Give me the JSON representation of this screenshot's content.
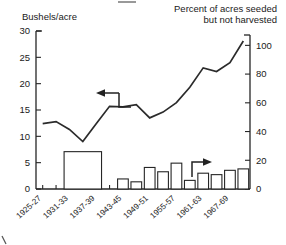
{
  "chart_data": {
    "type": "line",
    "title": "",
    "left_axis": {
      "label": "Bushels/acre",
      "ticks": [
        0,
        5,
        10,
        15,
        20,
        25,
        30
      ],
      "ylim": [
        0,
        30
      ],
      "unit": "bushels per acre"
    },
    "right_axis": {
      "label": "Percent of acres seeded but not harvested",
      "label_line1": "Percent of acres seeded",
      "label_line2": "but not harvested",
      "ticks": [
        0,
        20,
        40,
        60,
        80,
        100
      ],
      "ylim": [
        0,
        110
      ],
      "unit": "percent"
    },
    "xlabel": "",
    "categories": [
      "1925-27",
      "1928-30",
      "1931-33",
      "1934-36",
      "1937-39",
      "1940-42",
      "1943-45",
      "1946-48",
      "1949-51",
      "1952-54",
      "1955-57",
      "1958-60",
      "1961-63",
      "1964-66",
      "1967-69",
      "1970-72"
    ],
    "tick_labels_shown": [
      "1925-27",
      "1931-33",
      "1937-39",
      "1943-45",
      "1949-51",
      "1955-57",
      "1961-63",
      "1967-69"
    ],
    "grid": false,
    "legend": "none",
    "annotations": [
      {
        "name": "left-axis-arrow",
        "text": "",
        "points_to": "line-series",
        "direction": "left"
      },
      {
        "name": "right-axis-arrow",
        "text": "",
        "points_to": "bar-series",
        "direction": "right"
      }
    ],
    "series": [
      {
        "name": "Yield",
        "type": "line",
        "axis": "left",
        "unit": "bushels/acre",
        "values": [
          12.4,
          12.8,
          11.3,
          9.0,
          12.4,
          15.7,
          15.6,
          16.0,
          13.5,
          14.6,
          16.4,
          19.3,
          23.0,
          22.3,
          24.0,
          28.1
        ]
      },
      {
        "name": "Acres seeded but not harvested",
        "type": "bar",
        "axis": "right",
        "unit": "percent",
        "values": [
          0,
          0,
          26,
          26,
          26,
          0,
          7,
          5,
          15,
          12,
          18,
          6,
          11,
          10,
          13,
          14
        ]
      }
    ]
  },
  "colors": {
    "ink": "#1a1a1a",
    "line": "#2b2b2b",
    "bar_stroke": "#262626",
    "bar_fill": "#ffffff",
    "background": "#ffffff"
  }
}
